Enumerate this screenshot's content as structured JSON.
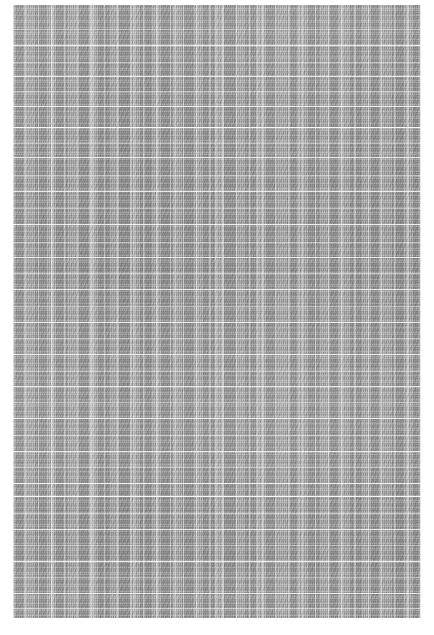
{
  "image": {
    "subject": "gray woven fabric texture swatch",
    "medium": "textile close-up",
    "width_px": 434,
    "height_px": 635,
    "background_color": "#ffffff",
    "alt_text": "Close-up photograph of a plain gray woven textile filling the frame, surrounded by a thin white margin."
  },
  "swatch": {
    "label": "fabric swatch",
    "left_px": 13,
    "top_px": 5,
    "width_px": 408,
    "height_px": 613,
    "base_color": "#9c9c9c",
    "highlight_color": "#c8c8c8",
    "shadow_color": "#7e7e7e",
    "weave": "plain weave",
    "warp_stripe_period_px": 13,
    "warp_fine_period_px": 2,
    "weft_fine_period_px": 2.4
  },
  "weft_lines": [
    {
      "y_px": 24,
      "weight": "soft"
    },
    {
      "y_px": 40,
      "weight": "normal"
    },
    {
      "y_px": 57,
      "weight": "soft"
    },
    {
      "y_px": 71,
      "weight": "normal"
    },
    {
      "y_px": 86,
      "weight": "soft"
    },
    {
      "y_px": 101,
      "weight": "normal"
    },
    {
      "y_px": 122,
      "weight": "strong"
    },
    {
      "y_px": 138,
      "weight": "soft"
    },
    {
      "y_px": 152,
      "weight": "normal"
    },
    {
      "y_px": 170,
      "weight": "soft"
    },
    {
      "y_px": 186,
      "weight": "normal"
    },
    {
      "y_px": 203,
      "weight": "soft"
    },
    {
      "y_px": 219,
      "weight": "normal"
    },
    {
      "y_px": 237,
      "weight": "soft"
    },
    {
      "y_px": 252,
      "weight": "normal"
    },
    {
      "y_px": 268,
      "weight": "soft"
    },
    {
      "y_px": 284,
      "weight": "normal"
    },
    {
      "y_px": 301,
      "weight": "soft"
    },
    {
      "y_px": 317,
      "weight": "normal"
    },
    {
      "y_px": 333,
      "weight": "soft"
    },
    {
      "y_px": 349,
      "weight": "normal"
    },
    {
      "y_px": 366,
      "weight": "soft"
    },
    {
      "y_px": 381,
      "weight": "normal"
    },
    {
      "y_px": 397,
      "weight": "soft"
    },
    {
      "y_px": 413,
      "weight": "normal"
    },
    {
      "y_px": 430,
      "weight": "soft"
    },
    {
      "y_px": 446,
      "weight": "normal"
    },
    {
      "y_px": 462,
      "weight": "soft"
    },
    {
      "y_px": 478,
      "weight": "normal"
    },
    {
      "y_px": 491,
      "weight": "strong"
    },
    {
      "y_px": 508,
      "weight": "soft"
    },
    {
      "y_px": 524,
      "weight": "normal"
    },
    {
      "y_px": 540,
      "weight": "soft"
    },
    {
      "y_px": 556,
      "weight": "normal"
    },
    {
      "y_px": 572,
      "weight": "soft"
    },
    {
      "y_px": 588,
      "weight": "normal"
    },
    {
      "y_px": 603,
      "weight": "soft"
    }
  ]
}
